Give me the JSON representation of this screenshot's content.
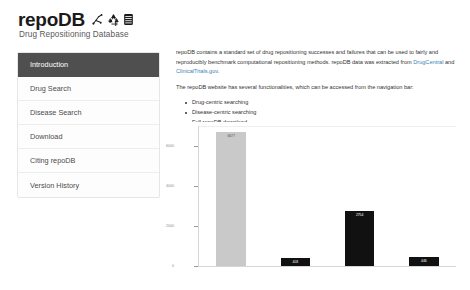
{
  "header": {
    "title": "repoDB",
    "subtitle": "Drug Repositioning Database",
    "icons": [
      "molecule-icon",
      "recycle-icon",
      "database-icon"
    ]
  },
  "sidebar": {
    "items": [
      {
        "label": "Introduction",
        "active": true
      },
      {
        "label": "Drug Search",
        "active": false
      },
      {
        "label": "Disease Search",
        "active": false
      },
      {
        "label": "Download",
        "active": false
      },
      {
        "label": "Citing repoDB",
        "active": false
      },
      {
        "label": "Version History",
        "active": false
      }
    ]
  },
  "main": {
    "paragraph1_part1": "repoDB contains a standard set of drug repositioning successes and failures that can be used to fairly and reproducibly benchmark computational repositioning methods. repoDB data was extracted from ",
    "link_drugcentral": "DrugCentral",
    "paragraph1_part2": " and ",
    "link_clinicaltrials": "ClinicalTrials.gov",
    "paragraph1_part3": ".",
    "paragraph2": "The repoDB website has several functionalities, which can be accessed from the navigation bar:",
    "bullets": [
      "Drug-centric searching",
      "Disease-centric searching",
      "Full repoDB download"
    ],
    "paragraph3": "You can explore the types and characteristics of data in repoDB in the plot below."
  },
  "chart_data": {
    "type": "bar",
    "title": "",
    "xlabel": "",
    "ylabel": "",
    "categories": [
      "Approved",
      "Suspended",
      "Terminated",
      "Withdrawn"
    ],
    "values": [
      6677,
      403,
      2754,
      446
    ],
    "value_labels": [
      "6677",
      "403",
      "2754",
      "446"
    ],
    "colors": [
      "#c9c9c9",
      "#111111",
      "#111111",
      "#111111"
    ],
    "ylim": [
      0,
      7000
    ],
    "yticks": [
      0,
      2000,
      4000,
      6000
    ],
    "ytick_labels": [
      "0",
      "2000",
      "4000",
      "6000"
    ],
    "grid": false,
    "legend": "none"
  }
}
